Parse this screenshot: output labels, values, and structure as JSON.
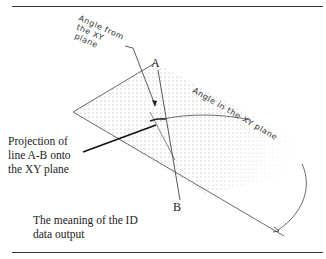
{
  "diagram": {
    "points": {
      "a": "A",
      "b": "B"
    },
    "annotations": {
      "angle_from_plane": [
        "Angle from",
        "the XY",
        "plane"
      ],
      "angle_in_plane": "Angle in the XY plane"
    },
    "projection_label": [
      "Projection of",
      "line A-B onto",
      "the XY plane"
    ],
    "caption": [
      "The meaning of the ID",
      "data output"
    ]
  },
  "colors": {
    "ink": "#333333",
    "dots": "#b0b0b0",
    "background": "#ffffff"
  }
}
